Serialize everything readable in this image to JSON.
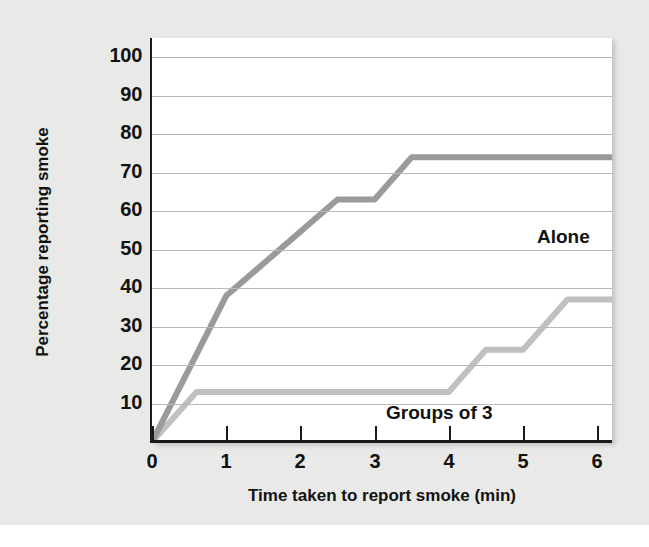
{
  "chart_data": {
    "type": "line",
    "title": "",
    "xlabel": "Time taken to report smoke (min)",
    "ylabel": "Percentage reporting smoke",
    "xlim": [
      0,
      6.2
    ],
    "ylim": [
      0,
      105
    ],
    "xticks": [
      "0",
      "1",
      "2",
      "3",
      "4",
      "5",
      "6"
    ],
    "xtick_values": [
      0,
      1,
      2,
      3,
      4,
      5,
      6
    ],
    "yticks": [
      "10",
      "20",
      "30",
      "40",
      "50",
      "60",
      "70",
      "80",
      "90",
      "100"
    ],
    "ytick_values": [
      10,
      20,
      30,
      40,
      50,
      60,
      70,
      80,
      90,
      100
    ],
    "grid": true,
    "legend_position": "inline-annotations",
    "series": [
      {
        "name": "Alone",
        "color": "#9a9a9a",
        "points": [
          [
            0,
            0
          ],
          [
            1,
            38
          ],
          [
            2.5,
            63
          ],
          [
            3,
            63
          ],
          [
            3.5,
            74
          ],
          [
            6.2,
            74
          ]
        ]
      },
      {
        "name": "Groups of 3",
        "color": "#c0c0c0",
        "points": [
          [
            0,
            0
          ],
          [
            0.6,
            13
          ],
          [
            4,
            13
          ],
          [
            4.5,
            24
          ],
          [
            5,
            24
          ],
          [
            5.6,
            37
          ],
          [
            6.2,
            37
          ]
        ]
      }
    ],
    "annotations": [
      {
        "text": "Alone",
        "x": 3.75,
        "y": 66
      },
      {
        "text": "Groups of 3",
        "x": 1.75,
        "y": 19
      }
    ]
  },
  "colors": {
    "background": "#e9e9e7",
    "panel": "#ffffff",
    "axis": "#1a1a1a",
    "gridline": "#b9b9b9",
    "text": "#121212",
    "series_alone": "#9a9a9a",
    "series_groups": "#c0c0c0"
  }
}
